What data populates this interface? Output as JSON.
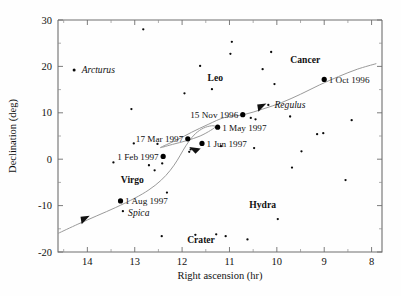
{
  "chart_data": {
    "type": "scatter",
    "title": "",
    "xlabel": "Right ascension (hr)",
    "ylabel": "Declination (deg)",
    "xlim": [
      14.62,
      7.78
    ],
    "ylim": [
      -20,
      30
    ],
    "x_reversed": true,
    "xticks": [
      14,
      13,
      12,
      11,
      10,
      9,
      8
    ],
    "xticklabels": [
      "14",
      "13",
      "12",
      "11",
      "10",
      "9",
      "8"
    ],
    "yticks": [
      30,
      20,
      10,
      0,
      -10,
      -20
    ],
    "yticklabels": [
      "30",
      "20",
      "10",
      "0",
      "-10",
      "-20"
    ],
    "grid": false,
    "legend": null,
    "series": [
      {
        "name": "Comet path",
        "type": "line",
        "style": "gray curve with retrograde loop",
        "points": [
          [
            14.62,
            -16.0
          ],
          [
            14.2,
            -14.0
          ],
          [
            13.8,
            -12.2
          ],
          [
            13.4,
            -10.4
          ],
          [
            13.0,
            -8.4
          ],
          [
            12.7,
            -6.6
          ],
          [
            12.45,
            -4.6
          ],
          [
            12.25,
            -2.4
          ],
          [
            12.1,
            -0.2
          ],
          [
            11.98,
            1.9
          ],
          [
            11.86,
            3.8
          ],
          [
            11.72,
            5.5
          ],
          [
            11.55,
            6.7
          ],
          [
            11.38,
            7.2
          ],
          [
            11.3,
            7.0
          ],
          [
            11.4,
            6.2
          ],
          [
            11.62,
            5.0
          ],
          [
            11.9,
            4.0
          ],
          [
            12.2,
            3.2
          ],
          [
            12.45,
            2.5
          ],
          [
            12.38,
            2.9
          ],
          [
            12.1,
            4.2
          ],
          [
            11.8,
            5.8
          ],
          [
            11.45,
            7.5
          ],
          [
            11.1,
            9.0
          ],
          [
            10.7,
            9.6
          ],
          [
            10.3,
            10.8
          ],
          [
            9.9,
            12.2
          ],
          [
            9.5,
            14.0
          ],
          [
            9.1,
            16.0
          ],
          [
            8.7,
            17.8
          ],
          [
            8.3,
            19.4
          ],
          [
            7.9,
            20.6
          ]
        ],
        "markers": [
          {
            "label": "1 Oct 1996",
            "ra": 9.0,
            "dec": 17.2,
            "label_pos": "right"
          },
          {
            "label": "15 Nov 1996",
            "ra": 10.72,
            "dec": 9.6,
            "label_pos": "left"
          },
          {
            "label": "1 May 1997",
            "ra": 11.25,
            "dec": 6.9,
            "label_pos": "right"
          },
          {
            "label": "17 Mar 1997",
            "ra": 11.88,
            "dec": 4.4,
            "label_pos": "left"
          },
          {
            "label": "1 Jun 1997",
            "ra": 11.58,
            "dec": 3.4,
            "label_pos": "right"
          },
          {
            "label": "1 Feb 1997",
            "ra": 12.4,
            "dec": 0.6,
            "label_pos": "left"
          },
          {
            "label": "1 Aug 1997",
            "ra": 13.3,
            "dec": -9.0,
            "label_pos": "right"
          }
        ],
        "arrows": [
          {
            "ra": 13.95,
            "dec": -12.2,
            "dir": "up-right"
          },
          {
            "ra": 11.85,
            "dec": 2.6,
            "dir": "up-left"
          },
          {
            "ra": 10.22,
            "dec": 12.0,
            "dir": "up-right"
          }
        ]
      },
      {
        "name": "Background stars",
        "type": "scatter",
        "stars": [
          {
            "ra": 14.28,
            "dec": 19.2,
            "mag": 2,
            "name": "Arcturus"
          },
          {
            "ra": 13.45,
            "dec": -0.7,
            "mag": 1
          },
          {
            "ra": 13.07,
            "dec": 10.8,
            "mag": 1
          },
          {
            "ra": 13.02,
            "dec": 3.4,
            "mag": 1
          },
          {
            "ra": 12.7,
            "dec": -1.3,
            "mag": 1
          },
          {
            "ra": 12.52,
            "dec": 3.3,
            "mag": 1
          },
          {
            "ra": 12.42,
            "dec": -0.9,
            "mag": 1
          },
          {
            "ra": 12.43,
            "dec": -16.6,
            "mag": 1
          },
          {
            "ra": 12.58,
            "dec": -2.4,
            "mag": 1
          },
          {
            "ra": 12.32,
            "dec": -7.2,
            "mag": 1
          },
          {
            "ra": 13.25,
            "dec": -11.2,
            "mag": 1,
            "name": "Spica"
          },
          {
            "ra": 11.95,
            "dec": 14.2,
            "mag": 1
          },
          {
            "ra": 11.85,
            "dec": 1.6,
            "mag": 1
          },
          {
            "ra": 11.82,
            "dec": 2.1,
            "mag": 1
          },
          {
            "ra": 11.72,
            "dec": -16.3,
            "mag": 1
          },
          {
            "ra": 11.62,
            "dec": 20.1,
            "mag": 1
          },
          {
            "ra": 11.37,
            "dec": 15.1,
            "mag": 1
          },
          {
            "ra": 11.18,
            "dec": 2.8,
            "mag": 1
          },
          {
            "ra": 11.28,
            "dec": -16.2,
            "mag": 1
          },
          {
            "ra": 11.08,
            "dec": -16.6,
            "mag": 1
          },
          {
            "ra": 10.95,
            "dec": 25.3,
            "mag": 1
          },
          {
            "ra": 10.98,
            "dec": 22.7,
            "mag": 1
          },
          {
            "ra": 10.55,
            "dec": 8.9,
            "mag": 1
          },
          {
            "ra": 10.45,
            "dec": 8.6,
            "mag": 1
          },
          {
            "ra": 10.62,
            "dec": -17.3,
            "mag": 1
          },
          {
            "ra": 10.48,
            "dec": 2.4,
            "mag": 1
          },
          {
            "ra": 10.3,
            "dec": 19.4,
            "mag": 1
          },
          {
            "ra": 10.18,
            "dec": 11.7,
            "mag": 1,
            "name": "Regulus"
          },
          {
            "ra": 10.12,
            "dec": 23.1,
            "mag": 1
          },
          {
            "ra": 10.05,
            "dec": 16.2,
            "mag": 1
          },
          {
            "ra": 9.98,
            "dec": -12.9,
            "mag": 1
          },
          {
            "ra": 9.72,
            "dec": 9.2,
            "mag": 1
          },
          {
            "ra": 9.68,
            "dec": -1.8,
            "mag": 1
          },
          {
            "ra": 9.48,
            "dec": 1.7,
            "mag": 1
          },
          {
            "ra": 9.15,
            "dec": 5.4,
            "mag": 1
          },
          {
            "ra": 9.02,
            "dec": 5.6,
            "mag": 1
          },
          {
            "ra": 8.42,
            "dec": 8.4,
            "mag": 1
          },
          {
            "ra": 8.55,
            "dec": -4.5,
            "mag": 1
          },
          {
            "ra": 12.82,
            "dec": 28.0,
            "mag": 1
          }
        ]
      }
    ],
    "annotations": [
      {
        "text": "Arcturus",
        "ra": 14.12,
        "dec": 19.2,
        "style": "italic",
        "kind": "star-name"
      },
      {
        "text": "Regulus",
        "ra": 10.05,
        "dec": 11.7,
        "style": "italic",
        "kind": "star-name"
      },
      {
        "text": "Spica",
        "ra": 13.14,
        "dec": -11.6,
        "style": "italic",
        "kind": "star-name"
      },
      {
        "text": "Leo",
        "ra": 11.3,
        "dec": 17.5,
        "style": "bold",
        "kind": "constellation"
      },
      {
        "text": "Cancer",
        "ra": 9.4,
        "dec": 21.5,
        "style": "bold",
        "kind": "constellation"
      },
      {
        "text": "Virgo",
        "ra": 13.05,
        "dec": -4.5,
        "style": "bold",
        "kind": "constellation"
      },
      {
        "text": "Hydra",
        "ra": 10.3,
        "dec": -9.8,
        "style": "bold",
        "kind": "constellation"
      },
      {
        "text": "Crater",
        "ra": 11.6,
        "dec": -17.4,
        "style": "bold",
        "kind": "constellation"
      }
    ]
  }
}
